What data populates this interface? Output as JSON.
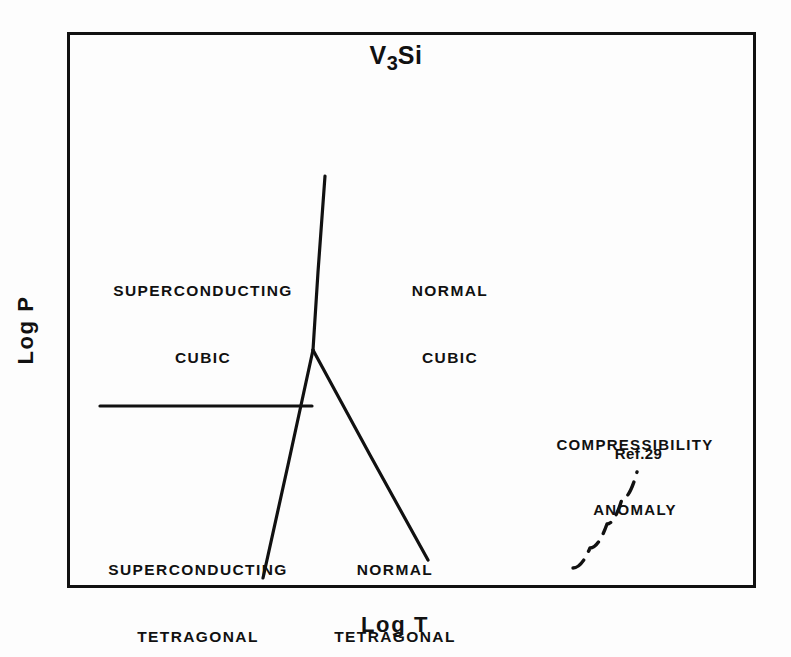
{
  "figure": {
    "title_main": "V",
    "title_sub": "3",
    "title_tail": "Si",
    "title_full": "V3Si",
    "axes": {
      "x_label": "Log T",
      "y_label": "Log P"
    },
    "frame": {
      "color": "#111111",
      "left": 67,
      "top": 32,
      "width": 689,
      "height": 556,
      "line_width": 3
    },
    "regions": [
      {
        "id": "superconducting-cubic",
        "line1": "SUPERCONDUCTING",
        "line2": "CUBIC"
      },
      {
        "id": "normal-cubic",
        "line1": "NORMAL",
        "line2": "CUBIC"
      },
      {
        "id": "superconducting-tetragonal",
        "line1": "SUPERCONDUCTING",
        "line2": "TETRAGONAL"
      },
      {
        "id": "normal-tetragonal",
        "line1": "NORMAL",
        "line2": "TETRAGONAL"
      }
    ],
    "annotation": {
      "line1": "COMPRESSIBILITY",
      "line2": "ANOMALY",
      "reference": "Ref.29"
    }
  },
  "chart_data": {
    "type": "line",
    "title": "V3Si",
    "xlabel": "Log T",
    "ylabel": "Log P",
    "grid": false,
    "legend": null,
    "axis_ticks": {
      "x": [],
      "y": []
    },
    "note": "Schematic pressure-temperature phase diagram; axes are logarithmic with no numeric tick labels.",
    "triple_point": {
      "x": 313,
      "y": 350
    },
    "series": [
      {
        "name": "cubic-tetragonal boundary (upper, near-vertical)",
        "style": "solid",
        "color": "#111111",
        "width": 3.2,
        "points": [
          [
            325,
            176
          ],
          [
            318,
            272
          ],
          [
            313,
            350
          ]
        ]
      },
      {
        "name": "superconducting-normal cubic boundary (horizontal)",
        "style": "solid",
        "color": "#111111",
        "width": 3.2,
        "points": [
          [
            100,
            406
          ],
          [
            312,
            406
          ]
        ]
      },
      {
        "name": "superconducting-normal tetragonal boundary (lower left branch)",
        "style": "solid",
        "color": "#111111",
        "width": 3.2,
        "points": [
          [
            313,
            350
          ],
          [
            288,
            465
          ],
          [
            263,
            578
          ]
        ]
      },
      {
        "name": "normal cubic-normal tetragonal boundary (right branch)",
        "style": "solid",
        "color": "#111111",
        "width": 3.2,
        "points": [
          [
            313,
            350
          ],
          [
            370,
            455
          ],
          [
            428,
            560
          ]
        ]
      },
      {
        "name": "compressibility anomaly (Ref.29)",
        "style": "dashed",
        "color": "#111111",
        "width": 3.4,
        "dash": "14 10",
        "points": [
          [
            573,
            568
          ],
          [
            590,
            548
          ],
          [
            607,
            524
          ],
          [
            622,
            499
          ],
          [
            637,
            472
          ]
        ]
      }
    ]
  }
}
